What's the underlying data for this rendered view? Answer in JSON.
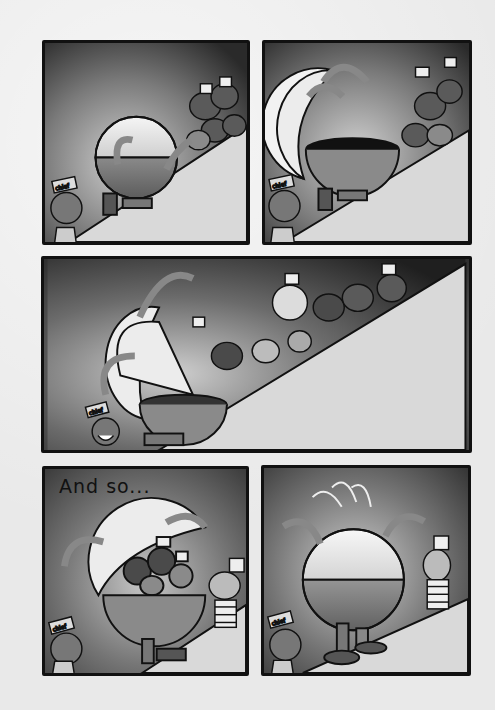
{
  "page": {
    "type": "comic-page",
    "colors": {
      "background": "#e9e9e9",
      "panel_border": "#111111",
      "sky_dark": "#2e2e2e",
      "sky_mid": "#6b6b6b",
      "slope": "#d6d6d6"
    }
  },
  "panels": [
    {
      "id": "panel-1",
      "description": "Round capsule robot climbing slope toward crowd of dogs in striped hats; chief watches",
      "characters": [
        "capsule-robot",
        "chief",
        "dog-crowd"
      ],
      "hat_label": "chief"
    },
    {
      "id": "panel-2",
      "description": "Capsule robot's top half flips open revealing empty bottom bowl",
      "characters": [
        "capsule-robot-open",
        "chief",
        "dog-crowd"
      ],
      "hat_label": "chief"
    },
    {
      "id": "panel-3",
      "description": "Dogs in striped prison outfits tumble down slope into open capsule",
      "characters": [
        "capsule-robot-open",
        "chief",
        "tumbling-dogs"
      ],
      "hat_label": "chief"
    },
    {
      "id": "panel-4",
      "caption": "And so...",
      "description": "Capsule filled with dogs, one dog in striped hat standing beside",
      "characters": [
        "capsule-robot-full",
        "chief",
        "dog"
      ],
      "hat_label": "chief"
    },
    {
      "id": "panel-5",
      "description": "Capsule robot closed, bouncing; dog watches, chief looks worried",
      "characters": [
        "capsule-robot-closed",
        "chief",
        "dog"
      ],
      "hat_label": "chief"
    }
  ]
}
